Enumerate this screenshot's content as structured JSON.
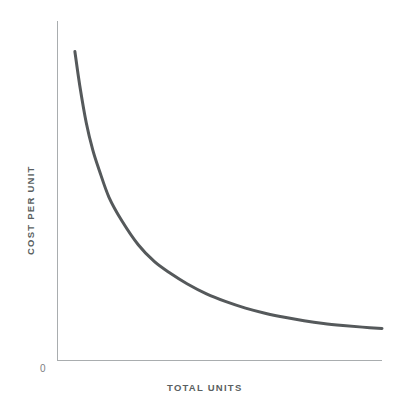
{
  "chart_data": {
    "type": "line",
    "title": "",
    "subtitle": "",
    "xlabel": "TOTAL UNITS",
    "ylabel": "COST PER UNIT",
    "origin_label": "0",
    "grid": false,
    "legend": false,
    "legend_position": "none",
    "xlim": [
      0,
      100
    ],
    "ylim": [
      0,
      100
    ],
    "xticks": [],
    "yticks": [],
    "xticklabels": [],
    "yticklabels": [],
    "annotations": [],
    "series": [
      {
        "name": "Cost per unit",
        "color": "#55595b",
        "linewidth": 3,
        "description": "Decreasing convex curve approaching a horizontal asymptote (economies of scale)",
        "x": [
          5.5,
          7,
          9,
          11,
          13,
          16,
          20,
          25,
          30,
          35,
          40,
          46,
          52,
          58,
          64,
          70,
          76,
          82,
          88,
          94,
          100
        ],
        "y": [
          91,
          81,
          70,
          62,
          56,
          48,
          41,
          34,
          29,
          25.5,
          22.5,
          19.5,
          17.2,
          15.3,
          13.8,
          12.6,
          11.6,
          10.8,
          10.2,
          9.7,
          9.3
        ]
      }
    ]
  },
  "axes": {
    "axis_color": "#a9adaf",
    "axis_width": 1,
    "background": "#ffffff",
    "label_color": "#5a5f61",
    "origin_color": "#7c8082"
  }
}
